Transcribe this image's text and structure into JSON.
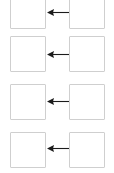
{
  "diagram": {
    "canvas": {
      "width": 114,
      "height": 173,
      "background": "#ffffff"
    },
    "style": {
      "box_border_color": "#cfcfcf",
      "box_fill_color": "#ffffff",
      "arrow_color": "#1b1b1b",
      "box_width": 36,
      "box_height": 36,
      "box_border_width": 1
    },
    "arrow_direction": "right-to-left",
    "row_count": 4,
    "rows": [
      {
        "id": "row-1",
        "top": -7,
        "box_top": 0,
        "box_height": 29,
        "arrow_top": 8,
        "source_label": "",
        "target_label": "",
        "clipped": "top"
      },
      {
        "id": "row-2",
        "top": 36,
        "box_top": 36,
        "box_height": 36,
        "arrow_top": 51,
        "source_label": "",
        "target_label": "",
        "clipped": "none"
      },
      {
        "id": "row-3",
        "top": 84,
        "box_top": 84,
        "box_height": 36,
        "arrow_top": 94,
        "source_label": "",
        "target_label": "",
        "clipped": "none"
      },
      {
        "id": "row-4",
        "top": 132,
        "box_top": 132,
        "box_height": 36,
        "arrow_top": 143,
        "source_label": "",
        "target_label": "",
        "clipped": "none"
      }
    ]
  }
}
